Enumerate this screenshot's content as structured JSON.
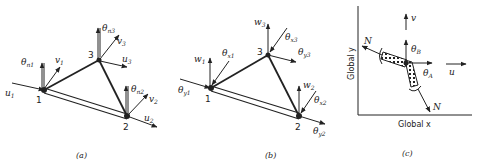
{
  "panels": [
    {
      "id": "a",
      "caption": "(a)",
      "nodes": [
        "1",
        "2",
        "3"
      ],
      "labels": {
        "theta_n1": "θ",
        "theta_n1_sub": "n1",
        "v1": "v",
        "v1_sub": "1",
        "u1": "u",
        "u1_sub": "1",
        "theta_n3": "θ",
        "theta_n3_sub": "n3",
        "v3": "v",
        "v3_sub": "3",
        "u3": "u",
        "u3_sub": "3",
        "theta_n2": "θ",
        "theta_n2_sub": "n2",
        "v2": "v",
        "v2_sub": "2",
        "u2": "u",
        "u2_sub": "2"
      }
    },
    {
      "id": "b",
      "caption": "(b)",
      "nodes": [
        "1",
        "2",
        "3"
      ],
      "labels": {
        "w1": "w",
        "w1_sub": "1",
        "theta_x1": "θ",
        "theta_x1_sub": "x1",
        "theta_y1": "θ",
        "theta_y1_sub": "y1",
        "w3": "w",
        "w3_sub": "3",
        "theta_x3": "θ",
        "theta_x3_sub": "x3",
        "theta_y3": "θ",
        "theta_y3_sub": "y3",
        "w2": "w",
        "w2_sub": "2",
        "theta_x2": "θ",
        "theta_x2_sub": "x2",
        "theta_y2": "θ",
        "theta_y2_sub": "y2"
      }
    },
    {
      "id": "c",
      "caption": "(c)",
      "labels": {
        "v": "v",
        "theta_B": "θ",
        "theta_B_sub": "B",
        "theta_A": "θ",
        "theta_A_sub": "A",
        "u": "u",
        "N_left": "N",
        "N_right": "N",
        "global_x": "Global x",
        "global_y": "Global y"
      }
    }
  ]
}
